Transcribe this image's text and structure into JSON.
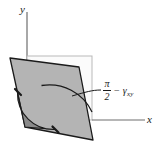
{
  "figure": {
    "background_color": "#ffffff",
    "axes": {
      "y_label": "y",
      "x_label": "x",
      "axis_color": "#6e6e6e"
    },
    "annotation": {
      "numerator": "π",
      "denominator": "2",
      "operator": "−",
      "gamma": "γ",
      "gamma_subscript": "xy",
      "full_text": "π/2 − γxy"
    },
    "shapes": {
      "reference_square": {
        "name": "undeformed-reference-square",
        "fill": "#fbfbfb",
        "stroke": "#b9b9b9"
      },
      "deformed_element": {
        "name": "sheared-parallelogram",
        "fill": "#b4b4b4",
        "stroke": "#1a1a1a"
      },
      "angle_sector": {
        "name": "deformed-angle-sector",
        "fill": "#8a8a8a",
        "stroke": "#1a1a1a"
      },
      "reference_arc": {
        "name": "original-right-angle-arc",
        "stroke": "#1a1a1a"
      }
    }
  }
}
